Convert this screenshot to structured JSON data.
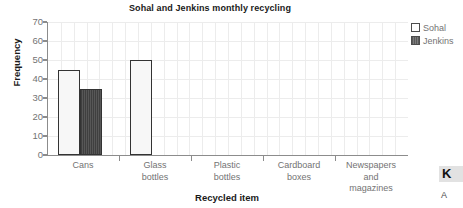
{
  "chart_data": {
    "type": "bar",
    "title": "Sohal and Jenkins monthly recycling",
    "xlabel": "Recycled item",
    "ylabel": "Frequency",
    "categories": [
      "Cans",
      "Glass bottles",
      "Plastic bottles",
      "Cardboard boxes",
      "Newspapers and magazines"
    ],
    "category_lines": [
      [
        "Cans"
      ],
      [
        "Glass",
        "bottles"
      ],
      [
        "Plastic",
        "bottles"
      ],
      [
        "Cardboard",
        "boxes"
      ],
      [
        "Newspapers",
        "and",
        "magazines"
      ]
    ],
    "series": [
      {
        "name": "Sohal",
        "values": [
          45,
          50,
          0,
          0,
          0
        ],
        "color": "#f7f7f7"
      },
      {
        "name": "Jenkins",
        "values": [
          35,
          0,
          0,
          0,
          0
        ],
        "color": "#4a4a4a"
      }
    ],
    "ylim": [
      0,
      70
    ],
    "ytick_values": [
      0,
      10,
      20,
      30,
      40,
      50,
      60,
      70
    ],
    "ytick_labels": [
      "0",
      "10",
      "20",
      "30",
      "40",
      "50",
      "60",
      "70"
    ],
    "grid": "minor-vertical-and-horizontal",
    "legend_position": "right-top"
  },
  "legend": {
    "entries": [
      {
        "label": "Sohal",
        "swatch": "open-square-swatch"
      },
      {
        "label": "Jenkins",
        "swatch": "filled-square-swatch"
      }
    ]
  },
  "page_margin": {
    "letter_k": "K",
    "letter_a": "A"
  }
}
